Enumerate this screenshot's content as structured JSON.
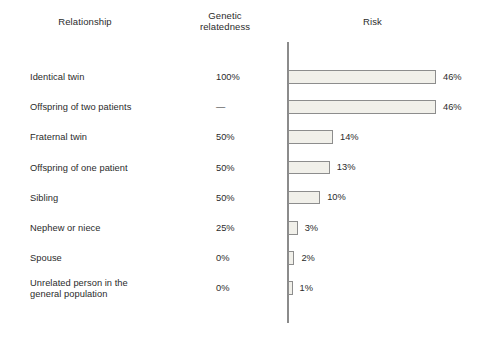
{
  "figure": {
    "headers": {
      "relationship": "Relationship",
      "genetic_line1": "Genetic",
      "genetic_line2": "relatedness",
      "risk": "Risk"
    }
  },
  "chart_data": {
    "type": "bar",
    "title": "Risk",
    "xlabel": "",
    "ylabel": "Relationship",
    "orientation": "horizontal",
    "grid": false,
    "legend": "none",
    "xlim": [
      0,
      50
    ],
    "categories": [
      "Identical twin",
      "Offspring of two patients",
      "Fraternal twin",
      "Offspring of one patient",
      "Sibling",
      "Nephew or niece",
      "Spouse",
      "Unrelated person in the general population"
    ],
    "values": [
      46,
      46,
      14,
      13,
      10,
      3,
      2,
      1
    ],
    "value_labels": [
      "46%",
      "46%",
      "14%",
      "13%",
      "10%",
      "3%",
      "2%",
      "1%"
    ],
    "genetic_relatedness": [
      "100%",
      "—",
      "50%",
      "50%",
      "50%",
      "25%",
      "0%",
      "0%"
    ],
    "series": [
      {
        "name": "Risk",
        "values": [
          46,
          46,
          14,
          13,
          10,
          3,
          2,
          1
        ]
      }
    ],
    "colors": {
      "bar_fill": "#f1f0ea",
      "bar_border": "#8d8d8d",
      "axis": "#8b8b8b",
      "text": "#2b2b2b",
      "background": "#ffffff"
    }
  },
  "rows": [
    {
      "label": "Identical twin",
      "label2": "",
      "genetic": "100%",
      "risk_label": "46%",
      "risk": 46
    },
    {
      "label": "Offspring of two patients",
      "label2": "",
      "genetic": "—",
      "risk_label": "46%",
      "risk": 46
    },
    {
      "label": "Fraternal twin",
      "label2": "",
      "genetic": "50%",
      "risk_label": "14%",
      "risk": 14
    },
    {
      "label": "Offspring of one patient",
      "label2": "",
      "genetic": "50%",
      "risk_label": "13%",
      "risk": 13
    },
    {
      "label": "Sibling",
      "label2": "",
      "genetic": "50%",
      "risk_label": "10%",
      "risk": 10
    },
    {
      "label": "Nephew or niece",
      "label2": "",
      "genetic": "25%",
      "risk_label": "3%",
      "risk": 3
    },
    {
      "label": "Spouse",
      "label2": "",
      "genetic": "0%",
      "risk_label": "2%",
      "risk": 2
    },
    {
      "label": "Unrelated person in the",
      "label2": "general population",
      "genetic": "0%",
      "risk_label": "1%",
      "risk": 1
    }
  ]
}
